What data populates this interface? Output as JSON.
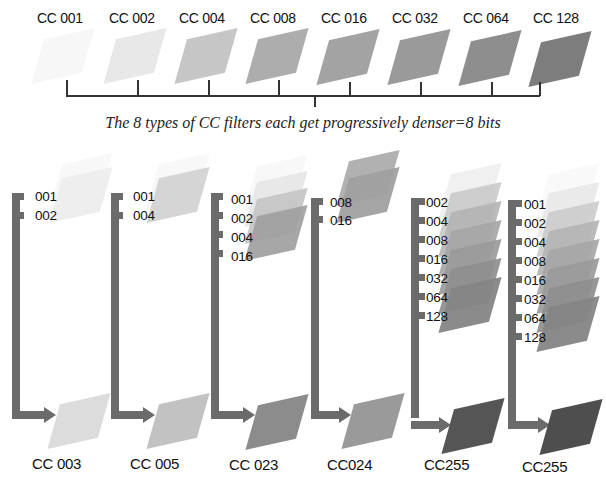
{
  "top_row": {
    "filters": [
      {
        "label": "CC 001",
        "value": 1,
        "color": "#f6f6f6"
      },
      {
        "label": "CC 002",
        "value": 2,
        "color": "#e6e6e6"
      },
      {
        "label": "CC 004",
        "value": 4,
        "color": "#c6c6c6"
      },
      {
        "label": "CC 008",
        "value": 8,
        "color": "#aeaeae"
      },
      {
        "label": "CC 016",
        "value": 16,
        "color": "#a2a2a2"
      },
      {
        "label": "CC 032",
        "value": 32,
        "color": "#999999"
      },
      {
        "label": "CC 064",
        "value": 64,
        "color": "#8e8e8e"
      },
      {
        "label": "CC 128",
        "value": 128,
        "color": "#7e7e7e"
      }
    ],
    "caption": "The 8 types of CC filters each get progressively denser=8 bits"
  },
  "combinations": [
    {
      "components": [
        "001",
        "002"
      ],
      "result_label": "CC 003",
      "result_color": "#dcdcdc"
    },
    {
      "components": [
        "001",
        "004"
      ],
      "result_label": "CC 005",
      "result_color": "#c2c2c2"
    },
    {
      "components": [
        "001",
        "002",
        "004",
        "016"
      ],
      "result_label": "CC 023",
      "result_color": "#8f8f8f"
    },
    {
      "components": [
        "008",
        "016"
      ],
      "result_label": "CC024",
      "result_color": "#9a9a9a"
    },
    {
      "components": [
        "002",
        "004",
        "008",
        "016",
        "032",
        "064",
        "128"
      ],
      "result_label": "CC255",
      "result_color": "#555555"
    },
    {
      "components": [
        "001",
        "002",
        "004",
        "008",
        "016",
        "032",
        "064",
        "128"
      ],
      "result_label": "CC255",
      "result_color": "#4e4e4e"
    }
  ],
  "colors": {
    "bracket": "#6b6b6b",
    "line": "#333333"
  }
}
